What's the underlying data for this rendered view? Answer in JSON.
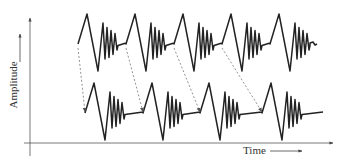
{
  "figure": {
    "type": "diagram",
    "y_axis": {
      "label": "Amplitude",
      "arrow": "up"
    },
    "x_axis": {
      "label": "Time",
      "arrow": "right"
    },
    "traces": [
      {
        "name": "upper-trace",
        "wavelet_count": 5,
        "wavelet_starts_px": [
          78,
          126,
          174,
          222,
          270
        ]
      },
      {
        "name": "lower-trace",
        "wavelet_count": 4,
        "wavelet_starts_px": [
          85,
          143,
          200,
          262
        ]
      }
    ],
    "dashed_arrows": [
      {
        "from_px": [
          78,
          48
        ],
        "to_px": [
          85,
          112
        ]
      },
      {
        "from_px": [
          126,
          48
        ],
        "to_px": [
          143,
          112
        ]
      },
      {
        "from_px": [
          174,
          48
        ],
        "to_px": [
          200,
          112
        ]
      },
      {
        "from_px": [
          222,
          48
        ],
        "to_px": [
          262,
          112
        ]
      }
    ],
    "colors": {
      "line": "#222222",
      "axis": "#555555",
      "dashed": "#777777",
      "text": "#333333"
    }
  }
}
